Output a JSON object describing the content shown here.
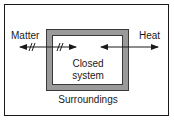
{
  "diagram": {
    "labels": {
      "matter": "Matter",
      "heat": "Heat",
      "system_line1": "Closed",
      "system_line2": "system",
      "surroundings": "Surroundings"
    },
    "arrows": [
      {
        "name": "matter-arrow",
        "direction": "bidirectional",
        "blocked": true,
        "hash_marks": 2
      },
      {
        "name": "heat-arrow",
        "direction": "bidirectional",
        "blocked": false
      }
    ],
    "colors": {
      "line": "#1a1a1a",
      "wall": "#9a9a9a",
      "background": "#ffffff"
    }
  }
}
